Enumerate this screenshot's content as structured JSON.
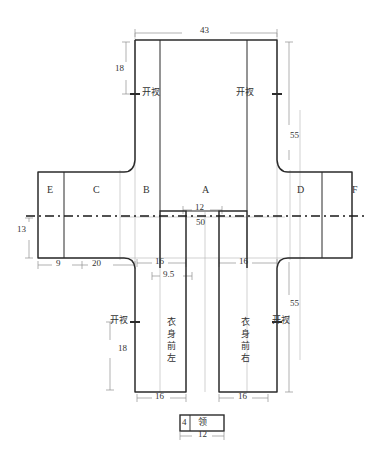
{
  "drawing": {
    "title": "garment-pattern-layout",
    "units_note": "",
    "pieces": [
      {
        "id": "E",
        "label": "E"
      },
      {
        "id": "C",
        "label": "C"
      },
      {
        "id": "B",
        "label": "B"
      },
      {
        "id": "A",
        "label": "A"
      },
      {
        "id": "D",
        "label": "D"
      },
      {
        "id": "F",
        "label": "F"
      }
    ],
    "body_labels": {
      "front_left": "衣身前左",
      "front_right": "衣身前右"
    },
    "vent_label": "开衩",
    "vents": [
      {
        "id": "vent-top-left",
        "label": "开衩"
      },
      {
        "id": "vent-top-right",
        "label": "开衩"
      },
      {
        "id": "vent-bottom-left",
        "label": "开衩"
      },
      {
        "id": "vent-bottom-right",
        "label": "开衩"
      }
    ],
    "dimensions": {
      "top_width": "43",
      "top_left_vent_depth": "18",
      "right_upper_height": "55",
      "right_lower_height": "55",
      "left_sleeve_height": "13",
      "left_cuff_width": "9",
      "left_sleeve_width": "20",
      "neck_width": "12",
      "neck_inner": "50",
      "front_left_top_width": "16",
      "front_left_offset": "9.5",
      "front_right_top_width": "16",
      "bottom_left_vent_depth": "18",
      "front_left_bottom_width": "16",
      "front_right_bottom_width": "16"
    },
    "collar": {
      "height_label": "4",
      "name_label": "领",
      "width_label": "12"
    },
    "colors": {
      "outline": "#2b2b2b",
      "thin_line": "#9a9a9a",
      "dim_line": "#a8a8a8",
      "center_line": "#1a1a1a",
      "background": "#ffffff"
    }
  }
}
